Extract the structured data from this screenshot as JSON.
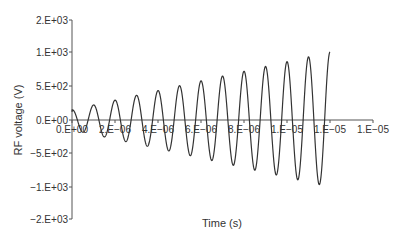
{
  "chart_data": {
    "type": "line",
    "title": "",
    "xlabel": "Time (s)",
    "ylabel": "RF voltage (V)",
    "x_tick_labels": [
      "0.E+00",
      "2.E−06",
      "4.E−06",
      "6.E−06",
      "8.E−06",
      "1.E−05",
      "1.E−05",
      "1.E−05"
    ],
    "x_tick_values": [
      0,
      2e-06,
      4e-06,
      6e-06,
      8e-06,
      1e-05,
      1.2e-05,
      1.4e-05
    ],
    "y_tick_labels": [
      "2.E+03",
      "1.E+03",
      "5.E+02",
      "0.E+00",
      "−5.E+02",
      "−1.E+03",
      "−2.E+03"
    ],
    "y_tick_values": [
      2000,
      1000,
      500,
      0,
      -500,
      -1000,
      -2000
    ],
    "xlim": [
      0,
      1.4e-05
    ],
    "ylim": [
      -2000,
      2000
    ],
    "grid": false,
    "legend": null,
    "series": [
      {
        "name": "RF voltage",
        "description": "Sinusoid with ~1 MHz frequency and linearly growing amplitude from ~150 V to ~1000 V over 0 to 12 microseconds",
        "frequency_hz": 1000000,
        "amplitude_start_v": 150,
        "amplitude_end_v": 1000,
        "t_start_s": 0,
        "t_end_s": 1.2e-05,
        "peaks": [
          {
            "t": 1e-06,
            "v": 180
          },
          {
            "t": 2e-06,
            "v": 260
          },
          {
            "t": 3e-06,
            "v": 330
          },
          {
            "t": 4e-06,
            "v": 400
          },
          {
            "t": 5e-06,
            "v": 470
          },
          {
            "t": 6e-06,
            "v": 550
          },
          {
            "t": 7e-06,
            "v": 620
          },
          {
            "t": 8e-06,
            "v": 700
          },
          {
            "t": 9e-06,
            "v": 780
          },
          {
            "t": 1e-05,
            "v": 860
          },
          {
            "t": 1.1e-05,
            "v": 930
          },
          {
            "t": 1.2e-05,
            "v": 1000
          }
        ],
        "troughs": [
          {
            "t": 5e-07,
            "v": -140
          },
          {
            "t": 1.5e-06,
            "v": -220
          },
          {
            "t": 2.5e-06,
            "v": -290
          },
          {
            "t": 3.5e-06,
            "v": -370
          },
          {
            "t": 4.5e-06,
            "v": -440
          },
          {
            "t": 5.5e-06,
            "v": -510
          },
          {
            "t": 6.5e-06,
            "v": -590
          },
          {
            "t": 7.5e-06,
            "v": -660
          },
          {
            "t": 8.5e-06,
            "v": -740
          },
          {
            "t": 9.5e-06,
            "v": -820
          },
          {
            "t": 1.05e-05,
            "v": -900
          },
          {
            "t": 1.15e-05,
            "v": -950
          }
        ]
      }
    ],
    "colors": {
      "line": "#333333",
      "axis": "#555555"
    }
  }
}
